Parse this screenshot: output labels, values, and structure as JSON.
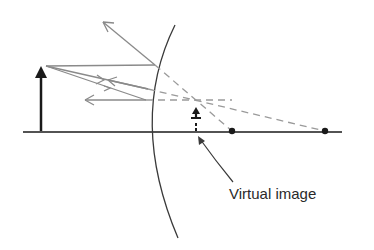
{
  "diagram": {
    "labels": {
      "virtual_image": "Virtual image"
    },
    "elements": {
      "object": "object-arrow",
      "mirror": "convex-mirror",
      "image": "virtual-image-arrow",
      "focal_point": "focal-point",
      "center_of_curvature": "center-of-curvature"
    },
    "colors": {
      "ray": "#8a8a8a",
      "ink": "#1a1a1a",
      "dashed": "#9a9a9a"
    }
  }
}
